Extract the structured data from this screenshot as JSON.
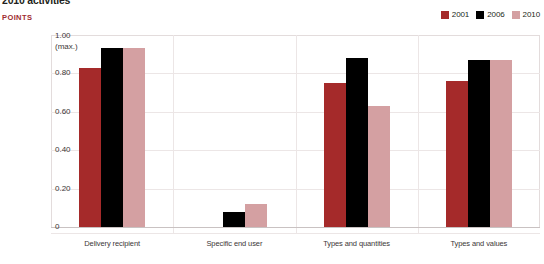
{
  "header": {
    "title": "2010 activities",
    "unit_label": "POINTS"
  },
  "legend": {
    "position": "top-right",
    "items": [
      {
        "label": "2001",
        "color": "#A52A2A"
      },
      {
        "label": "2006",
        "color": "#000000"
      },
      {
        "label": "2010",
        "color": "#D4A0A2"
      }
    ]
  },
  "axis": {
    "y_ticks": [
      {
        "label": "1.00\n(max.)",
        "value": 1.0
      },
      {
        "label": "0.80",
        "value": 0.8
      },
      {
        "label": "0.60",
        "value": 0.6
      },
      {
        "label": "0.40",
        "value": 0.4
      },
      {
        "label": "0.20",
        "value": 0.2
      },
      {
        "label": "0",
        "value": 0
      }
    ]
  },
  "chart_data": {
    "type": "bar",
    "title": "2010 activities",
    "xlabel": "",
    "ylabel": "POINTS",
    "ylim": [
      0,
      1.0
    ],
    "grid": true,
    "legend_position": "top-right",
    "categories": [
      "Delivery recipient",
      "Specific end user",
      "Types and quantities",
      "Types and values"
    ],
    "series": [
      {
        "name": "2001",
        "color": "#A52A2A",
        "values": [
          0.83,
          0.0,
          0.75,
          0.76
        ]
      },
      {
        "name": "2006",
        "color": "#000000",
        "values": [
          0.93,
          0.08,
          0.88,
          0.87
        ]
      },
      {
        "name": "2010",
        "color": "#D4A0A2",
        "values": [
          0.93,
          0.12,
          0.63,
          0.87
        ]
      }
    ]
  }
}
